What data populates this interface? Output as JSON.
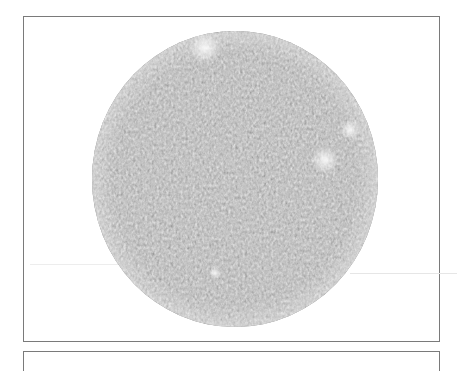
{
  "figure": {
    "frame": {
      "x": 23,
      "y": 16,
      "width": 417,
      "height": 326,
      "border_color": "#7a7a7a"
    },
    "next_frame": {
      "x": 23,
      "y": 351,
      "width": 417
    },
    "pattern": {
      "shape": "ellipse",
      "center_x": 235,
      "center_y": 179,
      "radius_x": 143,
      "radius_y": 148,
      "texture": "labyrinthine-stripe-pattern",
      "base_color": "#8c8c8c",
      "dark_color": "#3c3c3c",
      "light_color": "#e8e8e8",
      "bright_spots": [
        {
          "x": 215,
          "y": 273,
          "r": 6
        },
        {
          "x": 205,
          "y": 48,
          "r": 16
        },
        {
          "x": 325,
          "y": 160,
          "r": 14
        },
        {
          "x": 350,
          "y": 130,
          "r": 10
        }
      ]
    }
  }
}
